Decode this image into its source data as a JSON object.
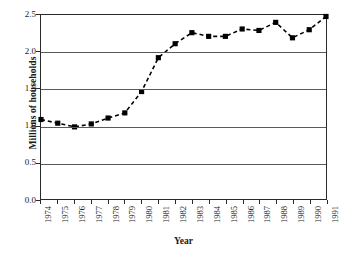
{
  "chart_data": {
    "type": "line",
    "title": "",
    "xlabel": "Year",
    "ylabel": "Millions of households",
    "categories": [
      "1974",
      "1975",
      "1976",
      "1977",
      "1978",
      "1979",
      "1980",
      "1981",
      "1982",
      "1983",
      "1984",
      "1985",
      "1986",
      "1987",
      "1988",
      "1989",
      "1990",
      "1991"
    ],
    "values": [
      1.08,
      1.03,
      0.98,
      1.02,
      1.1,
      1.17,
      1.46,
      1.92,
      2.11,
      2.26,
      2.21,
      2.21,
      2.31,
      2.29,
      2.4,
      2.19,
      2.3,
      2.48
    ],
    "series": [
      {
        "name": "Millions of households",
        "values": [
          1.08,
          1.03,
          0.98,
          1.02,
          1.1,
          1.17,
          1.46,
          1.92,
          2.11,
          2.26,
          2.21,
          2.21,
          2.31,
          2.29,
          2.4,
          2.19,
          2.3,
          2.48
        ]
      }
    ],
    "ylim": [
      0.0,
      2.5
    ],
    "yticks": [
      "0.0",
      "0.5",
      "1.0",
      "1.5",
      "2.0",
      "2.5"
    ],
    "ytick_values": [
      0.0,
      0.5,
      1.0,
      1.5,
      2.0,
      2.5
    ],
    "grid": "horizontal",
    "legend": "none",
    "line_style": "dashed",
    "marker": "square",
    "line_color": "#000000",
    "marker_color": "#000000",
    "grid_color": "#5a5a5a",
    "axis_color": "#2a2a2a",
    "background": "#ffffff"
  }
}
